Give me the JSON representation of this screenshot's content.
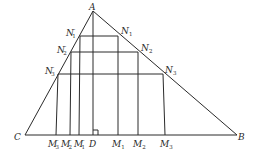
{
  "diagram": {
    "type": "geometry-triangle-with-inscribed-rectangles",
    "points": {
      "A": {
        "label": "A",
        "x": 93,
        "y": 11
      },
      "B": {
        "label": "B",
        "x": 237,
        "y": 135
      },
      "C": {
        "label": "C",
        "x": 25,
        "y": 135
      },
      "D": {
        "label": "D",
        "x": 93,
        "y": 135
      }
    },
    "rectangles": [
      {
        "top_left": "N1'",
        "top_right": "N1",
        "bottom_left": "M1'",
        "bottom_right": "M1"
      },
      {
        "top_left": "N2'",
        "top_right": "N2",
        "bottom_left": "M2'",
        "bottom_right": "M2"
      },
      {
        "top_left": "N3'",
        "top_right": "N3",
        "bottom_left": "M3'",
        "bottom_right": "M3"
      }
    ],
    "labels": {
      "A": "A",
      "B": "B",
      "C": "C",
      "D": "D",
      "N1": "N",
      "N1_sub": "1",
      "N2": "N",
      "N2_sub": "2",
      "N3": "N",
      "N3_sub": "3",
      "N1p": "N",
      "N1p_sub": "1",
      "N1p_prime": "′",
      "N2p": "N",
      "N2p_sub": "2",
      "N2p_prime": "′",
      "N3p": "N",
      "N3p_sub": "3",
      "N3p_prime": "′",
      "M1": "M",
      "M1_sub": "1",
      "M2": "M",
      "M2_sub": "2",
      "M3": "M",
      "M3_sub": "3",
      "M1p": "M",
      "M1p_sub": "1",
      "M1p_prime": "′",
      "M2p": "M",
      "M2p_sub": "2",
      "M2p_prime": "′",
      "M3p": "M",
      "M3p_sub": "3",
      "M3p_prime": "′"
    },
    "annotations": [
      "AD ⊥ CB (right-angle mark at D)"
    ]
  }
}
